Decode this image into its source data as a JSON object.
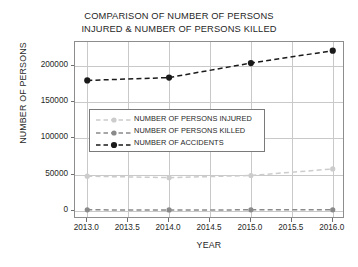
{
  "chart_data": {
    "type": "line",
    "title": "COMPARISON OF NUMBER OF PERSONS INJURED & NUMBER OF PERSONS KILLED",
    "title_lines": [
      "COMPARISON OF NUMBER OF PERSONS",
      "INJURED & NUMBER OF PERSONS KILLED"
    ],
    "xlabel": "YEAR",
    "ylabel": "NUMBER OF PERSONS",
    "x": [
      2013,
      2014,
      2015,
      2016
    ],
    "xlim": [
      2012.85,
      2016.15
    ],
    "ylim": [
      -11000,
      233000
    ],
    "xticks": [
      2013.0,
      2013.5,
      2014.0,
      2014.5,
      2015.0,
      2015.5,
      2016.0
    ],
    "xticklabels": [
      "2013.0",
      "2013.5",
      "2014.0",
      "2014.5",
      "2015.0",
      "2015.5",
      "2016.0"
    ],
    "yticks": [
      0,
      50000,
      100000,
      150000,
      200000
    ],
    "yticklabels": [
      "0",
      "50000",
      "100000",
      "150000",
      "200000"
    ],
    "grid": true,
    "legend_position": "center-left",
    "series": [
      {
        "name": "NUMBER OF PERSONS INJURED",
        "values": [
          48000,
          46000,
          49000,
          58000
        ],
        "color": "#cccccc",
        "marker": "o",
        "linestyle": "dashed"
      },
      {
        "name": "NUMBER OF PERSONS KILLED",
        "values": [
          1600,
          1500,
          1600,
          1700
        ],
        "color": "#8a8a8a",
        "marker": "o",
        "linestyle": "dashed"
      },
      {
        "name": "NUMBER OF ACCIDENTS",
        "values": [
          180000,
          184000,
          204000,
          221000
        ],
        "color": "#1a1a1a",
        "marker": "o",
        "linestyle": "dashed"
      }
    ]
  },
  "legend": {
    "entries": [
      {
        "label": "NUMBER OF PERSONS INJURED",
        "color": "#cccccc"
      },
      {
        "label": "NUMBER OF PERSONS KILLED",
        "color": "#8a8a8a"
      },
      {
        "label": "NUMBER OF ACCIDENTS",
        "color": "#1a1a1a"
      }
    ]
  },
  "style": {
    "axis_color": "#8d8d8d",
    "grid_color": "#c9c9c9",
    "text_color": "#1f1f1f",
    "background": "#ffffff"
  }
}
